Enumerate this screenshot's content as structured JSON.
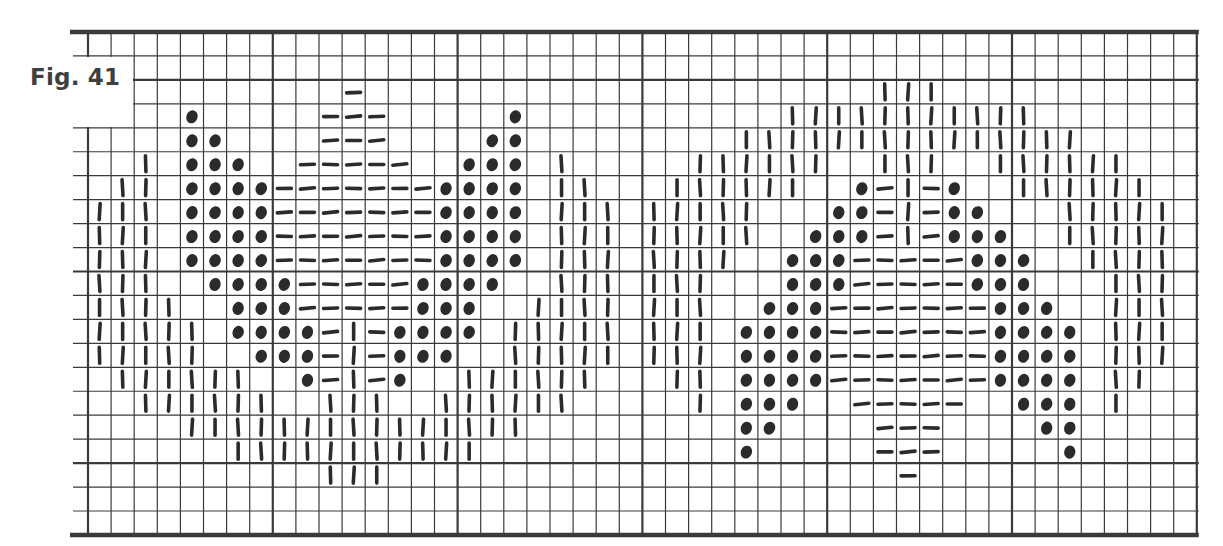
{
  "figure": {
    "label": "Fig. 41"
  },
  "legend": {
    "D": "dot",
    "H": "dash",
    "V": "vertical-bar",
    ".": "empty"
  },
  "colors": {
    "ink": "#2b2b2b",
    "grid": "#3a3a3a",
    "paper": "#ffffff",
    "label": "#3f3f3f"
  },
  "chart_data": {
    "type": "table",
    "title": "Fig. 41",
    "columns": 48,
    "rows": 21,
    "thick_every": 8,
    "thick_rows": [
      0,
      2,
      10,
      18,
      21
    ],
    "thick_cols": [
      0,
      8,
      16,
      24,
      32,
      40,
      48
    ],
    "cells": [
      "................................................",
      "................................................",
      "...........H......................VVV...........",
      "....D.....HHH.....D...........VVVVVVVVVVV.......",
      "....DD....HHH....DD.........VVVVVVVVVVVVVVV.....",
      "..V.DDD..HHHHH..DDD.V.....VVVVVV..VVV..VVVVVV...",
      ".VV.DDDDHHHHHHHDDDD.VV...VVVVVV..DHVHD..VVVVVV..",
      "VVV.DDDDHHHHHHHDDDD.VVV.VVVVV...DDHVHDD...VVVVV.",
      "VVV.DDDDHHHHHHHDDDD.VVV.VVVVV..DDDHVHDDD..VVVVV.",
      "VVV.DDDDHHHHHHHDDDD.VVV.VVVV..DDDHHHHHDDD..VVVV.",
      "VVV..DDDDHHHHHDDDD..VVV.VVV...DDDHHHHHDDD...VVV.",
      "VVVV..DDDHHHHHDDD..VVVV.VVV..DDDHHHHHHHDDD..VVV.",
      "VVVVV.DDDDHVHDDDD.VVVVV.VVV.DDDDHHHHHHHDDDD.VVV.",
      "VVVVV..DDDHVHDDD..VVVVV.VVV.DDDDHHHHHHHDDDD.VVV.",
      ".VVVVVV..DHVHD..VVVVVV...VV.DDDDHHHHHHHDDDD.VV..",
      "..VVVVVV..VVV..VVVVVV.....V.DDD..HHHHH..DDD.V...",
      "....VVVVVVVVVVVVVVV.........DD....HHH....DD.....",
      "......VVVVVVVVVVV...........D.....HHH.....D.....",
      "..........VVV......................H............",
      "................................................",
      "................................................"
    ]
  }
}
